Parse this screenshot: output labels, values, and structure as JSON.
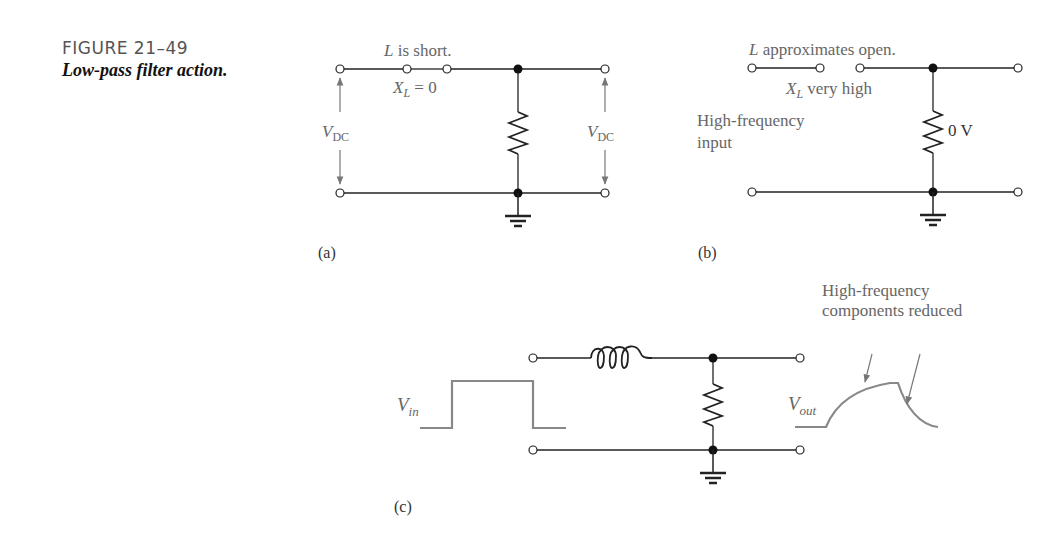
{
  "caption": {
    "figure_number": "FIGURE 21–49",
    "title": "Low-pass filter action."
  },
  "panel_a": {
    "label": "(a)",
    "inductor_note": "L is short.",
    "inductor_note_L": "L",
    "inductor_note_rest": " is short.",
    "reactance_X": "X",
    "reactance_sub": "L",
    "reactance_rest": " = 0",
    "input_voltage_V": "V",
    "input_voltage_sub": "DC",
    "output_voltage_V": "V",
    "output_voltage_sub": "DC"
  },
  "panel_b": {
    "label": "(b)",
    "inductor_note_L": "L",
    "inductor_note_rest": " approximates open.",
    "reactance_X": "X",
    "reactance_sub": "L",
    "reactance_rest": " very high",
    "input_line1": "High-frequency",
    "input_line2": "input",
    "resistor_voltage": "0 V"
  },
  "panel_c": {
    "label": "(c)",
    "input_V": "V",
    "input_sub": "in",
    "output_V": "V",
    "output_sub": "out",
    "annotation_line1": "High-frequency",
    "annotation_line2": "components reduced"
  },
  "colors": {
    "wire": "#222222",
    "annotation": "#777777",
    "waveform": "#888888"
  }
}
